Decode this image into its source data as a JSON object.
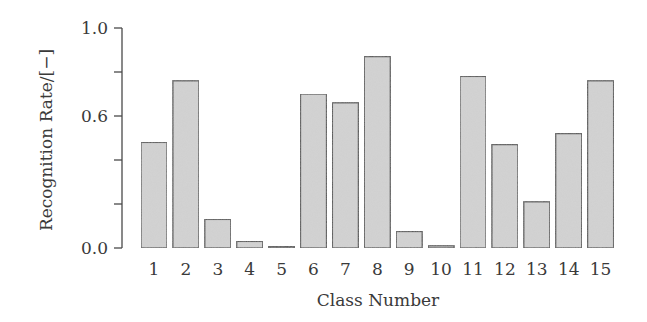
{
  "chart_data": {
    "type": "bar",
    "title": "",
    "xlabel": "Class Number",
    "ylabel": "Recognition Rate/[−]",
    "ylim": [
      0,
      1.0
    ],
    "yticks": [
      0.0,
      0.2,
      0.4,
      0.6,
      0.8,
      1.0
    ],
    "ytick_labels": [
      "0.0",
      "",
      "",
      "0.6",
      "",
      "1.0"
    ],
    "grid": false,
    "legend": null,
    "categories": [
      "1",
      "2",
      "3",
      "4",
      "5",
      "6",
      "7",
      "8",
      "9",
      "10",
      "11",
      "12",
      "13",
      "14",
      "15"
    ],
    "values": [
      0.48,
      0.76,
      0.13,
      0.03,
      0.005,
      0.7,
      0.66,
      0.87,
      0.075,
      0.01,
      0.78,
      0.47,
      0.21,
      0.52,
      0.76
    ]
  },
  "style": {
    "bar_fill": "#d4d4d4",
    "bar_stroke": "#4a4a4a",
    "axis_color": "#4a4a4a",
    "text_color": "#3a3a3a"
  }
}
